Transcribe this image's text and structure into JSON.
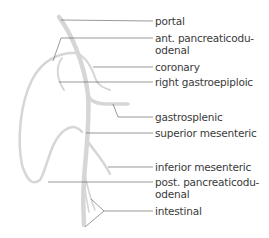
{
  "diagram": {
    "colors": {
      "vessel": "#d6d6d6",
      "leader": "#555555",
      "text": "#3a3a3a"
    },
    "labels": [
      {
        "id": "portal",
        "text": "portal",
        "line2": ""
      },
      {
        "id": "ant-pancreaticoduodenal",
        "text": "ant. pancreaticodu-",
        "line2": "odenal"
      },
      {
        "id": "coronary",
        "text": "coronary",
        "line2": ""
      },
      {
        "id": "right-gastroepiploic",
        "text": "right gastroepiploic",
        "line2": ""
      },
      {
        "id": "gastrosplenic",
        "text": "gastrosplenic",
        "line2": ""
      },
      {
        "id": "superior-mesenteric",
        "text": "superior mesenteric",
        "line2": ""
      },
      {
        "id": "inferior-mesenteric",
        "text": "inferior mesenteric",
        "line2": ""
      },
      {
        "id": "post-pancreaticoduodenal",
        "text": "post. pancreaticodu-",
        "line2": "odenal"
      },
      {
        "id": "intestinal",
        "text": "intestinal",
        "line2": ""
      }
    ]
  }
}
